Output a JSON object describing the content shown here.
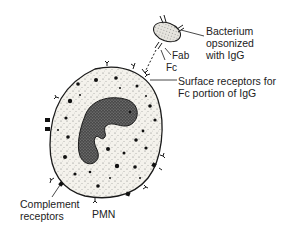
{
  "diagram": {
    "type": "biological-illustration",
    "labels": {
      "bacterium_line1": "Bacterium",
      "bacterium_line2": "opsonized",
      "bacterium_line3": "with IgG",
      "fab": "Fab",
      "fc": "Fc",
      "surface_line1": "Surface receptors for",
      "surface_line2": "Fc portion of IgG",
      "complement_line1": "Complement",
      "complement_line2": "receptors",
      "cell": "PMN"
    },
    "colors": {
      "ink": "#1a1a1a",
      "cytoplasm": "#f2f0ea",
      "nucleus": "#555555",
      "bacterium": "#d8d6d0"
    }
  }
}
